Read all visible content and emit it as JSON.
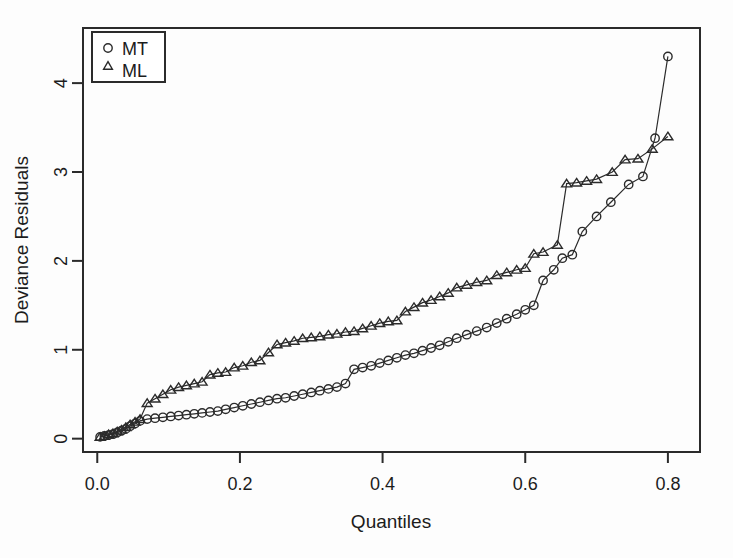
{
  "chart_data": {
    "type": "scatter",
    "title": "",
    "subtitle": "",
    "xlabel": "Quantiles",
    "ylabel": "Deviance Residuals",
    "xlim": [
      -0.02,
      0.845
    ],
    "ylim": [
      -0.15,
      4.62
    ],
    "xticks": [
      0.0,
      0.2,
      0.4,
      0.6,
      0.8
    ],
    "xticklabels": [
      "0.0",
      "0.2",
      "0.4",
      "0.6",
      "0.8"
    ],
    "yticks": [
      0,
      1,
      2,
      3,
      4
    ],
    "yticklabels": [
      "0",
      "1",
      "2",
      "3",
      "4"
    ],
    "grid": false,
    "legend_position": "top-left",
    "legend_entries": [
      {
        "label": "MT",
        "marker": "circle"
      },
      {
        "label": "ML",
        "marker": "triangle"
      }
    ],
    "series": [
      {
        "name": "MT",
        "marker": "circle",
        "line": true,
        "x": [
          0.004,
          0.01,
          0.016,
          0.022,
          0.028,
          0.034,
          0.04,
          0.046,
          0.053,
          0.06,
          0.07,
          0.081,
          0.092,
          0.103,
          0.114,
          0.125,
          0.136,
          0.147,
          0.158,
          0.169,
          0.18,
          0.192,
          0.204,
          0.216,
          0.228,
          0.24,
          0.252,
          0.264,
          0.276,
          0.288,
          0.3,
          0.312,
          0.324,
          0.336,
          0.348,
          0.36,
          0.372,
          0.384,
          0.396,
          0.408,
          0.42,
          0.432,
          0.444,
          0.456,
          0.468,
          0.48,
          0.492,
          0.504,
          0.518,
          0.532,
          0.546,
          0.56,
          0.574,
          0.588,
          0.6,
          0.612,
          0.625,
          0.64,
          0.652,
          0.666,
          0.68,
          0.7,
          0.72,
          0.745,
          0.765,
          0.782,
          0.8
        ],
        "y": [
          0.02,
          0.03,
          0.04,
          0.05,
          0.07,
          0.09,
          0.11,
          0.14,
          0.17,
          0.2,
          0.22,
          0.23,
          0.24,
          0.25,
          0.26,
          0.27,
          0.28,
          0.29,
          0.3,
          0.31,
          0.33,
          0.35,
          0.37,
          0.39,
          0.41,
          0.43,
          0.45,
          0.46,
          0.48,
          0.5,
          0.52,
          0.54,
          0.56,
          0.58,
          0.62,
          0.78,
          0.8,
          0.82,
          0.85,
          0.88,
          0.91,
          0.94,
          0.96,
          0.99,
          1.02,
          1.05,
          1.09,
          1.13,
          1.17,
          1.21,
          1.25,
          1.3,
          1.35,
          1.4,
          1.45,
          1.5,
          1.78,
          1.9,
          2.03,
          2.07,
          2.33,
          2.5,
          2.66,
          2.86,
          2.95,
          3.38,
          4.3
        ]
      },
      {
        "name": "ML",
        "marker": "triangle",
        "line": true,
        "x": [
          0.004,
          0.01,
          0.016,
          0.022,
          0.028,
          0.034,
          0.04,
          0.046,
          0.053,
          0.06,
          0.07,
          0.081,
          0.092,
          0.103,
          0.114,
          0.125,
          0.136,
          0.147,
          0.158,
          0.169,
          0.18,
          0.192,
          0.204,
          0.216,
          0.228,
          0.24,
          0.252,
          0.264,
          0.276,
          0.288,
          0.3,
          0.312,
          0.324,
          0.336,
          0.348,
          0.36,
          0.372,
          0.384,
          0.396,
          0.408,
          0.42,
          0.432,
          0.444,
          0.456,
          0.468,
          0.48,
          0.492,
          0.504,
          0.518,
          0.532,
          0.546,
          0.56,
          0.574,
          0.588,
          0.6,
          0.612,
          0.625,
          0.645,
          0.658,
          0.672,
          0.686,
          0.7,
          0.722,
          0.74,
          0.758,
          0.778,
          0.8
        ],
        "y": [
          0.02,
          0.03,
          0.05,
          0.06,
          0.08,
          0.1,
          0.13,
          0.16,
          0.19,
          0.22,
          0.4,
          0.45,
          0.5,
          0.55,
          0.58,
          0.6,
          0.62,
          0.64,
          0.72,
          0.74,
          0.75,
          0.8,
          0.82,
          0.86,
          0.88,
          0.97,
          1.06,
          1.08,
          1.1,
          1.13,
          1.14,
          1.15,
          1.17,
          1.18,
          1.2,
          1.21,
          1.24,
          1.27,
          1.3,
          1.32,
          1.33,
          1.43,
          1.48,
          1.53,
          1.56,
          1.6,
          1.64,
          1.7,
          1.73,
          1.76,
          1.78,
          1.84,
          1.87,
          1.9,
          1.92,
          2.08,
          2.1,
          2.18,
          2.87,
          2.88,
          2.9,
          2.92,
          3.0,
          3.14,
          3.15,
          3.26,
          3.4
        ]
      }
    ]
  },
  "figure": {
    "background_color": "#fdfdfd",
    "foreground_color": "#2b2b2b"
  }
}
